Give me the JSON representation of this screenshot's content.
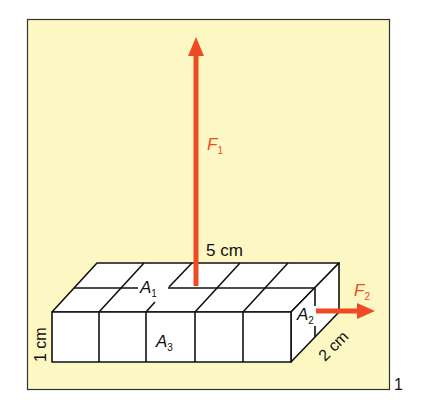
{
  "figure": {
    "number": "1",
    "background_color": "#fdf7c3",
    "force_color": "#ee4a24",
    "labels": {
      "length": "5 cm",
      "height": "1 cm",
      "depth": "2 cm",
      "force1": "F",
      "force1_sub": "1",
      "force2": "F",
      "force2_sub": "2",
      "area1": "A",
      "area1_sub": "1",
      "area2": "A",
      "area2_sub": "2",
      "area3": "A",
      "area3_sub": "3"
    }
  }
}
